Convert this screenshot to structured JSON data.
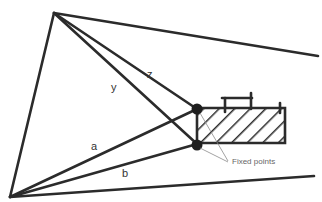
{
  "diagram": {
    "labels": {
      "z": "z",
      "y": "y",
      "a": "a",
      "b": "b",
      "fixed_points": "Fixed points"
    },
    "points": {
      "apex_top": [
        54,
        13
      ],
      "apex_bottom": [
        10,
        197
      ],
      "fixed_upper": [
        197,
        109
      ],
      "fixed_lower": [
        197,
        144
      ]
    }
  }
}
